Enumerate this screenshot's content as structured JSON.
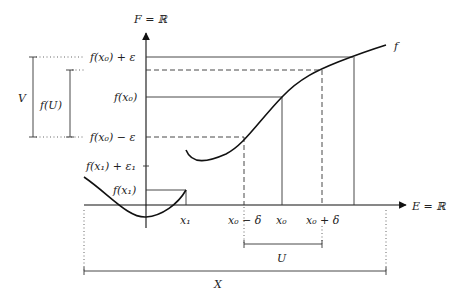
{
  "diagram": {
    "type": "continuity-epsilon-delta",
    "axes": {
      "y_label": "F = ℝ",
      "x_label": "E = ℝ"
    },
    "function_label": "f",
    "y_ticks": [
      {
        "id": "fx0_plus_eps",
        "label": "f(x₀) + ε"
      },
      {
        "id": "fx0",
        "label": "f(x₀)"
      },
      {
        "id": "fx0_minus_eps",
        "label": "f(x₀) − ε"
      },
      {
        "id": "fx1_plus_eps1",
        "label": "f(x₁) + ε₁"
      },
      {
        "id": "fx1",
        "label": "f(x₁)"
      }
    ],
    "x_ticks": [
      {
        "id": "x1",
        "label": "x₁"
      },
      {
        "id": "x0_minus_delta",
        "label": "x₀ − δ"
      },
      {
        "id": "x0",
        "label": "x₀"
      },
      {
        "id": "x0_plus_delta",
        "label": "x₀ + δ"
      }
    ],
    "brackets": {
      "V": "V",
      "fU": "f(U)",
      "U": "U",
      "X": "X"
    }
  }
}
